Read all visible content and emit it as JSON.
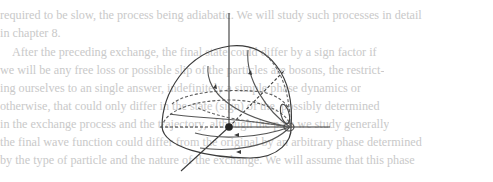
{
  "page": {
    "background_text_lines": [
      "required to be slow, the process being adiabatic. We will study such processes in detail",
      "in chapter 8.",
      "After the preceding exchange, the final state could differ by a sign factor if",
      "we will be any free loss or possible slip of the particles are bosons, the restrict-",
      "ing ourselves to an single answer, indefinitely a simple phase dynamics or",
      "otherwise, that could only differ in the state (sign) of the, possibly determined",
      "in the exchange process and the trajectory, although the path we study generally",
      "the final wave function could differ from the original by an arbitrary phase determined",
      "by the type of particle and the nature of the exchange. We will assume that this phase"
    ]
  },
  "figure": {
    "colors": {
      "stroke": "#3a3a3a",
      "light_stroke": "#6a6a6a",
      "origin_dot": "#222222"
    }
  }
}
